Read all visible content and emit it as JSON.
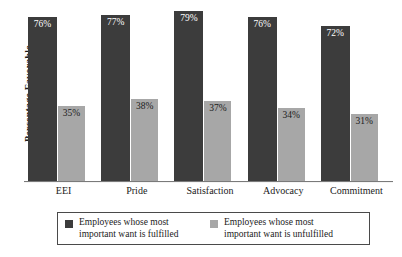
{
  "chart_data": {
    "type": "bar",
    "title": "",
    "xlabel": "",
    "ylabel": "Percentage Favorable",
    "ylim": [
      0,
      84
    ],
    "grid": false,
    "legend_position": "bottom",
    "categories": [
      "EEI",
      "Pride",
      "Satisfaction",
      "Advocacy",
      "Commitment"
    ],
    "series": [
      {
        "name": "Employees whose most important want is fulfilled",
        "color": "#3c3c3c",
        "values": [
          76,
          77,
          79,
          76,
          72
        ],
        "labels": [
          "76%",
          "77%",
          "79%",
          "76%",
          "72%"
        ]
      },
      {
        "name": "Employees whose most important want is unfulfilled",
        "color": "#a7a7a7",
        "values": [
          35,
          38,
          37,
          34,
          31
        ],
        "labels": [
          "35%",
          "38%",
          "37%",
          "34%",
          "31%"
        ]
      }
    ]
  },
  "legend": {
    "items": [
      {
        "label": "Employees whose most\nimportant want is fulfilled",
        "swatch": "dark"
      },
      {
        "label": "Employees whose most\nimportant want is unfulfilled",
        "swatch": "light"
      }
    ]
  }
}
